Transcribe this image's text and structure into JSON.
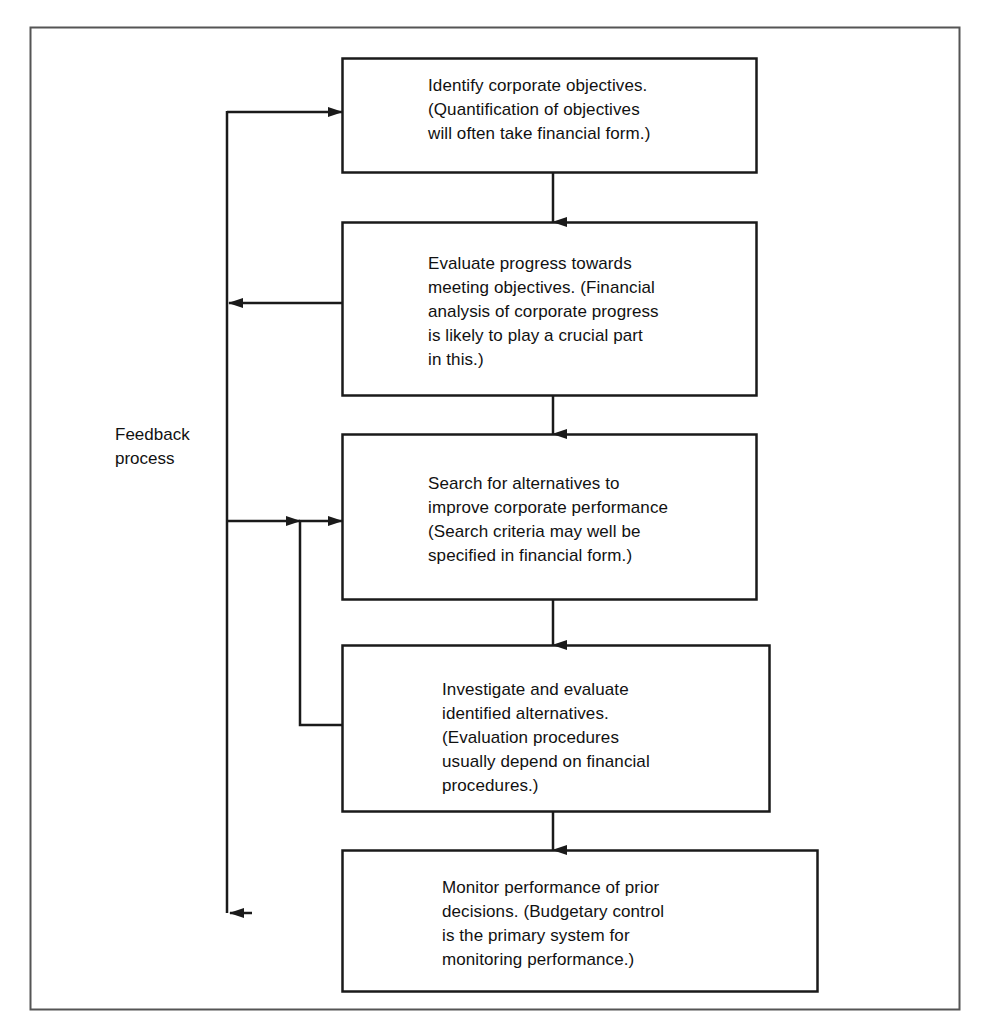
{
  "diagram": {
    "type": "flowchart",
    "colors": {
      "line": "#1a1a1a",
      "text": "#111111",
      "background": "#ffffff",
      "frame": "#555555"
    },
    "frame": {
      "x": 30,
      "y": 27,
      "width": 930,
      "height": 983
    },
    "nodes": [
      {
        "id": "node-1",
        "name": "identify-corporate-objectives",
        "text": "Identify corporate objectives.\n(Quantification of objectives\nwill often take financial form.)",
        "x": 342,
        "y": 58,
        "width": 415,
        "height": 115,
        "text_x": 428,
        "text_y": 74
      },
      {
        "id": "node-2",
        "name": "evaluate-progress",
        "text": "Evaluate progress towards\nmeeting objectives. (Financial\nanalysis of corporate progress\nis likely to play a crucial part\nin this.)",
        "x": 342,
        "y": 222,
        "width": 415,
        "height": 174,
        "text_x": 428,
        "text_y": 252
      },
      {
        "id": "node-3",
        "name": "search-for-alternatives",
        "text": "Search for alternatives to\nimprove corporate performance\n(Search criteria may well be\nspecified in financial form.)",
        "x": 342,
        "y": 434,
        "width": 415,
        "height": 166,
        "text_x": 428,
        "text_y": 472
      },
      {
        "id": "node-4",
        "name": "investigate-and-evaluate",
        "text": "Investigate and evaluate\nidentified alternatives.\n(Evaluation procedures\nusually depend on financial\nprocedures.)",
        "x": 342,
        "y": 645,
        "width": 428,
        "height": 167,
        "text_x": 442,
        "text_y": 678
      },
      {
        "id": "node-5",
        "name": "monitor-performance",
        "text": "Monitor performance of prior\ndecisions. (Budgetary control\nis the primary system for\nmonitoring performance.)",
        "x": 342,
        "y": 850,
        "width": 476,
        "height": 142,
        "text_x": 442,
        "text_y": 876
      }
    ],
    "feedback_label": {
      "text": "Feedback\nprocess",
      "x": 115,
      "y": 423
    },
    "connectors": [
      {
        "name": "arrow-node1-to-node2",
        "from": "node-1",
        "to": "node-2",
        "kind": "down",
        "x": 553,
        "y1": 173,
        "y2": 222
      },
      {
        "name": "arrow-node2-to-node3",
        "from": "node-2",
        "to": "node-3",
        "kind": "down",
        "x": 553,
        "y1": 396,
        "y2": 434
      },
      {
        "name": "arrow-node3-to-node4",
        "from": "node-3",
        "to": "node-4",
        "kind": "down",
        "x": 553,
        "y1": 600,
        "y2": 645
      },
      {
        "name": "arrow-node4-to-node5",
        "from": "node-4",
        "to": "node-5",
        "kind": "down",
        "x": 553,
        "y1": 812,
        "y2": 850
      },
      {
        "name": "feedback-node2-to-outer-line",
        "from": "node-2",
        "to": "feedback-bus",
        "kind": "left",
        "y": 303,
        "x1": 342,
        "x2": 227
      },
      {
        "name": "feedback-outer-line-to-node1",
        "from": "feedback-bus",
        "to": "node-1",
        "kind": "right",
        "y": 112,
        "x1": 227,
        "x2": 342
      },
      {
        "name": "feedback-outer-line-to-node3",
        "from": "feedback-bus",
        "to": "node-3",
        "kind": "right",
        "y": 521,
        "x1": 227,
        "x2": 342
      },
      {
        "name": "feedback-bus-vertical",
        "from": "node-1",
        "to": "node-5",
        "kind": "vertical",
        "x": 227,
        "y1": 112,
        "y2": 913
      },
      {
        "name": "feedback-bus-terminal-arrow",
        "kind": "left-terminal",
        "x": 227,
        "y": 913
      },
      {
        "name": "feedback-node4-to-node3",
        "from": "node-4",
        "to": "node-3",
        "kind": "loop",
        "x": 300,
        "y1": 725,
        "y2": 521
      }
    ]
  }
}
